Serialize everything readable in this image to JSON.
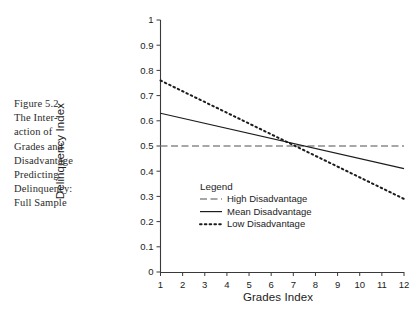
{
  "figure": {
    "caption_lines": [
      "Figure 5.2.",
      "The Inter-",
      "action of",
      "Grades and",
      "Disadvantage",
      "Predicting",
      "Delinquency:",
      "Full Sample"
    ]
  },
  "legend": {
    "title": "Legend",
    "entries": [
      {
        "label": "High Disadvantage",
        "style": "dash-dot",
        "color": "#8a8a8a"
      },
      {
        "label": "Mean Disadvantage",
        "style": "solid",
        "color": "#1c1c1c"
      },
      {
        "label": "Low Disadvantage",
        "style": "dotted",
        "color": "#1c1c1c"
      }
    ]
  },
  "chart_data": {
    "type": "line",
    "title": "",
    "xlabel": "Grades Index",
    "ylabel": "Delinquency Index",
    "x": [
      1,
      2,
      3,
      4,
      5,
      6,
      7,
      8,
      9,
      10,
      11,
      12
    ],
    "xlim": [
      1,
      12
    ],
    "ylim": [
      0,
      1
    ],
    "xticks": [
      "1",
      "2",
      "3",
      "4",
      "5",
      "6",
      "7",
      "8",
      "9",
      "10",
      "11",
      "12"
    ],
    "yticks": [
      "0",
      "0.1",
      "0.2",
      "0.3",
      "0.4",
      "0.5",
      "0.6",
      "0.7",
      "0.8",
      "0.9",
      "1"
    ],
    "grid": false,
    "legend_position": "inside-lower-center",
    "series": [
      {
        "name": "High Disadvantage",
        "style": "dash-dot",
        "color": "#8a8a8a",
        "endpoints": {
          "x1": 1,
          "y1": 0.5,
          "x2": 12,
          "y2": 0.5
        },
        "values": [
          0.5,
          0.5,
          0.5,
          0.5,
          0.5,
          0.5,
          0.5,
          0.5,
          0.5,
          0.5,
          0.5,
          0.5
        ]
      },
      {
        "name": "Mean Disadvantage",
        "style": "solid",
        "color": "#1c1c1c",
        "endpoints": {
          "x1": 1,
          "y1": 0.63,
          "x2": 12,
          "y2": 0.41
        },
        "values": [
          0.63,
          0.61,
          0.59,
          0.57,
          0.55,
          0.53,
          0.51,
          0.49,
          0.47,
          0.45,
          0.43,
          0.41
        ]
      },
      {
        "name": "Low Disadvantage",
        "style": "dotted",
        "color": "#1c1c1c",
        "endpoints": {
          "x1": 1,
          "y1": 0.76,
          "x2": 12,
          "y2": 0.29
        },
        "values": [
          0.76,
          0.72,
          0.67,
          0.63,
          0.59,
          0.55,
          0.5,
          0.46,
          0.42,
          0.38,
          0.33,
          0.29
        ]
      }
    ],
    "annotations": [
      {
        "text": "All three lines intersect near x = 7, y = 0.50"
      }
    ]
  }
}
